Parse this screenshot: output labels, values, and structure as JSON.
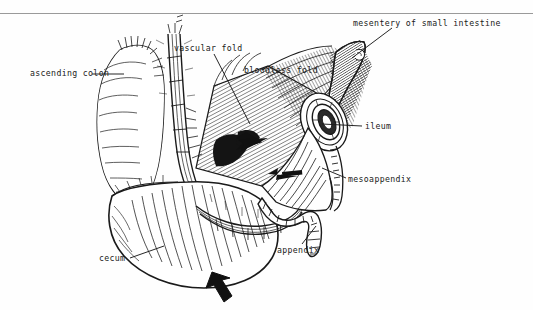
{
  "page": {
    "width": 533,
    "height": 310,
    "background_color": "#fefefe",
    "ink_color": "#1a1a1a",
    "rule_color": "#9a9a9a",
    "figure_kind": "pen-and-ink line drawing"
  },
  "labels": {
    "mesentery_of_small_intestine": "mesentery of small intestine",
    "vascular_fold": "vascular fold",
    "bloodless_fold": "bloodless fold",
    "ascending_colon": "ascending colon",
    "ileum": "ileum",
    "mesoappendix": "mesoappendix",
    "appendix": "appendix",
    "cecum": "cecum"
  },
  "icons": {
    "pointer_arrow_upper": "solid-arrow-left-icon",
    "pointer_arrow_middle": "solid-arrow-left-icon",
    "pointer_arrow_bottom": "solid-arrow-up-left-icon"
  },
  "structures": [
    "ascending colon",
    "cecum",
    "appendix",
    "ileum",
    "mesoappendix",
    "vascular fold",
    "bloodless fold",
    "mesentery of small intestine"
  ]
}
